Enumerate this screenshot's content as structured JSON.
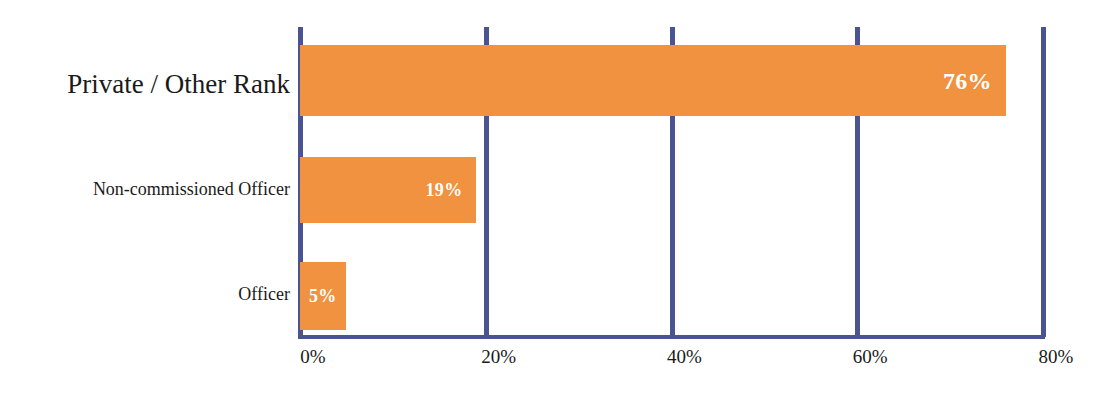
{
  "chart_data": {
    "type": "bar",
    "orientation": "horizontal",
    "title": "",
    "xlabel": "",
    "ylabel": "",
    "categories": [
      "Private / Other Rank",
      "Non-commissioned Officer",
      "Officer"
    ],
    "values": [
      76,
      19,
      5
    ],
    "data_labels": [
      "76%",
      "19%",
      "5%"
    ],
    "xlim": [
      0,
      80
    ],
    "xticks": [
      0,
      20,
      40,
      60,
      80
    ],
    "xtick_labels": [
      "0%",
      "20%",
      "40%",
      "60%",
      "80%"
    ],
    "grid": true,
    "legend": false,
    "colors": {
      "bar": "#f0923f",
      "axis": "#4a5490",
      "label_text": "#1a1a1a",
      "value_text": "#ffffff",
      "background": "#ffffff"
    }
  },
  "bars": [
    {
      "category": "Private / Other Rank",
      "value": 76,
      "label": "76%",
      "label_position": "inside-right",
      "label_size": 24
    },
    {
      "category": "Non-commissioned Officer",
      "value": 19,
      "label": "19%",
      "label_position": "inside-right",
      "label_size": 17
    },
    {
      "category": "Officer",
      "value": 5,
      "label": "5%",
      "label_position": "inside-left",
      "label_size": 17
    }
  ],
  "axis": {
    "ticks": [
      {
        "label": "0%",
        "value": 0
      },
      {
        "label": "20%",
        "value": 20
      },
      {
        "label": "40%",
        "value": 40
      },
      {
        "label": "60%",
        "value": 60
      },
      {
        "label": "80%",
        "value": 80
      }
    ]
  }
}
